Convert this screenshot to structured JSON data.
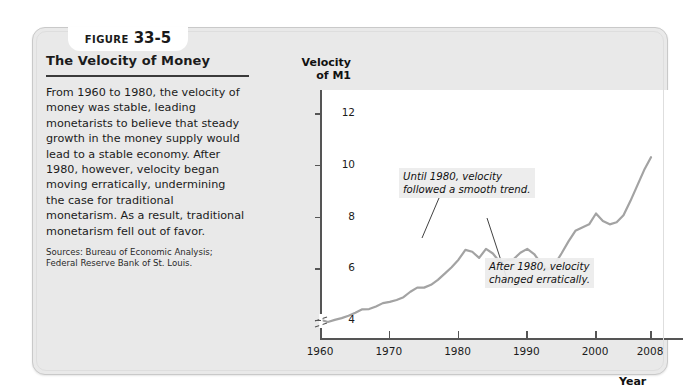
{
  "figure": {
    "tab_word": "Figure",
    "tab_number": "33-5",
    "title": "The Velocity of Money",
    "body": "From 1960 to 1980, the velocity of money was stable, leading monetarists to believe that steady growth in the money supply would lead to a stable economy. After 1980, however, velocity began moving erratically, undermining the case for traditional monetarism. As a result, traditional monetarism fell out of favor.",
    "sources": "Sources: Bureau of Economic Analysis; Federal Reserve Bank of St. Louis."
  },
  "chart_data": {
    "type": "line",
    "title": "The Velocity of Money",
    "xlabel": "Year",
    "ylabel": "Velocity of M1",
    "ylabel_line1": "Velocity",
    "ylabel_line2": "of M1",
    "xlim": [
      1960,
      2008
    ],
    "ylim": [
      3.3,
      12.9
    ],
    "y_axis_break": true,
    "grid": false,
    "legend": null,
    "line_color": "#a0a0a0",
    "xticks": [
      1960,
      1970,
      1980,
      1990,
      2000,
      2008
    ],
    "xtick_labels": [
      "1960",
      "1970",
      "1980",
      "1990",
      "2000",
      "2008"
    ],
    "yticks": [
      4,
      6,
      8,
      10,
      12
    ],
    "ytick_labels": [
      "4",
      "6",
      "8",
      "10",
      "12"
    ],
    "x": [
      1960,
      1961,
      1962,
      1963,
      1964,
      1965,
      1966,
      1967,
      1968,
      1969,
      1970,
      1971,
      1972,
      1973,
      1974,
      1975,
      1976,
      1977,
      1978,
      1979,
      1980,
      1981,
      1982,
      1983,
      1984,
      1985,
      1986,
      1987,
      1988,
      1989,
      1990,
      1991,
      1992,
      1993,
      1994,
      1995,
      1996,
      1997,
      1998,
      1999,
      2000,
      2001,
      2002,
      2003,
      2004,
      2005,
      2006,
      2007,
      2008
    ],
    "y": [
      4.0,
      3.92,
      4.0,
      4.07,
      4.16,
      4.28,
      4.41,
      4.42,
      4.52,
      4.65,
      4.7,
      4.77,
      4.88,
      5.09,
      5.25,
      5.25,
      5.36,
      5.55,
      5.79,
      6.04,
      6.33,
      6.71,
      6.64,
      6.4,
      6.75,
      6.57,
      6.24,
      6.31,
      6.35,
      6.6,
      6.75,
      6.55,
      6.2,
      5.95,
      6.15,
      6.58,
      7.04,
      7.45,
      7.58,
      7.7,
      8.12,
      7.83,
      7.7,
      7.78,
      8.05,
      8.6,
      9.2,
      9.8,
      10.3
    ],
    "annotations": [
      {
        "text": "Until 1980, velocity\nfollowed a smooth trend.",
        "x": 1975,
        "y": 5.4
      },
      {
        "text": "After 1980, velocity\nchanged erratically.",
        "x": 1983,
        "y": 6.6
      }
    ]
  }
}
